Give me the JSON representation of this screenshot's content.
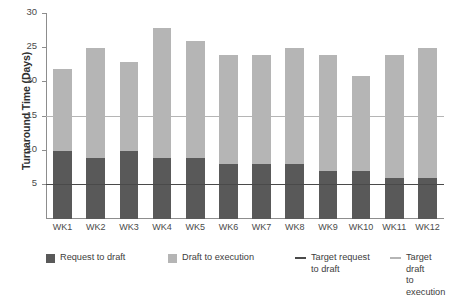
{
  "chart_data": {
    "type": "bar",
    "subtype": "stacked-bar",
    "title": "",
    "xlabel": "",
    "ylabel": "Turnaround Time (Days)",
    "categories": [
      "WK1",
      "WK2",
      "WK3",
      "WK4",
      "WK5",
      "WK6",
      "WK7",
      "WK8",
      "WK9",
      "WK10",
      "WK11",
      "WK12"
    ],
    "series": [
      {
        "name": "Request to draft",
        "color": "#595959",
        "values": [
          10,
          9,
          10,
          9,
          9,
          8,
          8,
          8,
          7,
          7,
          6,
          6
        ]
      },
      {
        "name": "Draft to execution",
        "color": "#b5b5b5",
        "values": [
          12,
          16,
          13,
          19,
          17,
          16,
          16,
          17,
          17,
          14,
          18,
          19
        ]
      }
    ],
    "totals": [
      22,
      25,
      23,
      28,
      26,
      24,
      24,
      25,
      24,
      21,
      24,
      25
    ],
    "reference_lines": [
      {
        "name": "Target request to draft",
        "value": 5,
        "color": "#4a4a4a"
      },
      {
        "name": "Target draft to execution",
        "value": 15,
        "color": "#b5b5b5"
      }
    ],
    "ylim": [
      0,
      30
    ],
    "yticks": [
      5,
      10,
      15,
      20,
      25,
      30
    ],
    "ytick_labels": [
      "5",
      "10",
      "15",
      "20",
      "25",
      "30"
    ],
    "grid": false,
    "legend_position": "bottom"
  },
  "legend": {
    "items": [
      {
        "label": "Request to draft",
        "marker": "square-swatch",
        "color": "#595959"
      },
      {
        "label": "Draft to execution",
        "marker": "square-swatch",
        "color": "#b5b5b5"
      },
      {
        "label": "Target request\nto draft",
        "marker": "line-dash",
        "color": "#4a4a4a"
      },
      {
        "label": "Target draft\nto execution",
        "marker": "line-dash",
        "color": "#b5b5b5"
      }
    ]
  }
}
